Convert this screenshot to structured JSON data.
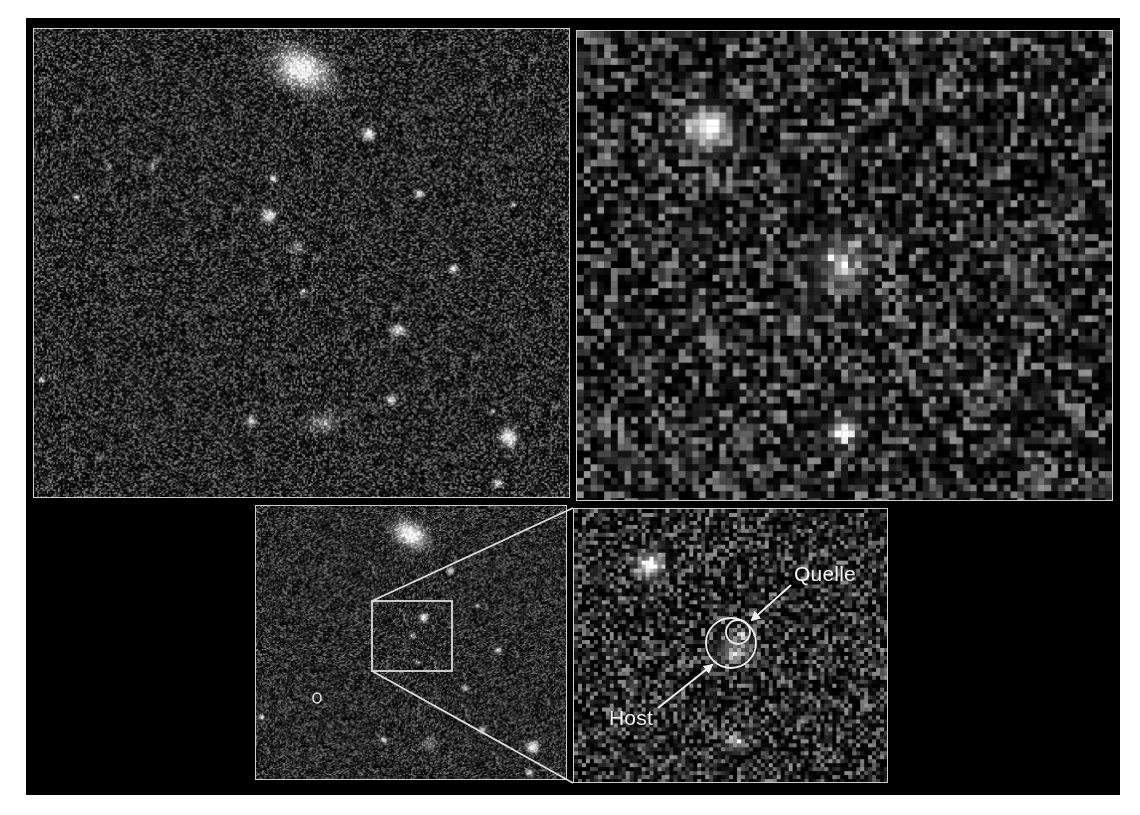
{
  "figure": {
    "background": "#000000",
    "border_color": "#cfcfcf",
    "panels": [
      {
        "id": "wide-field",
        "description": "wide field deep image, noisy background with galaxies and point sources",
        "box": [
          33,
          28,
          537,
          470
        ],
        "pixel_size": 1.6,
        "sources": [
          {
            "x": 268,
            "y": 40,
            "r": 22,
            "b": 1.0,
            "ex": 1.5,
            "rot": 0.5
          },
          {
            "x": 335,
            "y": 105,
            "r": 7,
            "b": 1.0
          },
          {
            "x": 235,
            "y": 187,
            "r": 8,
            "b": 1.0
          },
          {
            "x": 386,
            "y": 165,
            "r": 5,
            "b": 0.9
          },
          {
            "x": 240,
            "y": 150,
            "r": 4,
            "b": 0.8
          },
          {
            "x": 480,
            "y": 175,
            "r": 3,
            "b": 0.7
          },
          {
            "x": 420,
            "y": 240,
            "r": 5,
            "b": 0.9
          },
          {
            "x": 263,
            "y": 218,
            "r": 8,
            "b": 0.45
          },
          {
            "x": 270,
            "y": 263,
            "r": 4,
            "b": 0.55
          },
          {
            "x": 365,
            "y": 302,
            "r": 6,
            "b": 0.85,
            "ex": 1.6
          },
          {
            "x": 117,
            "y": 138,
            "r": 6,
            "b": 0.45
          },
          {
            "x": 75,
            "y": 138,
            "r": 3,
            "b": 0.65
          },
          {
            "x": 7,
            "y": 352,
            "r": 3,
            "b": 0.9
          },
          {
            "x": 358,
            "y": 372,
            "r": 5,
            "b": 1.0
          },
          {
            "x": 217,
            "y": 393,
            "r": 6,
            "b": 0.85
          },
          {
            "x": 290,
            "y": 395,
            "r": 12,
            "b": 0.4,
            "ex": 1.5
          },
          {
            "x": 476,
            "y": 410,
            "r": 10,
            "b": 1.0
          },
          {
            "x": 465,
            "y": 455,
            "r": 5,
            "b": 0.9
          },
          {
            "x": 460,
            "y": 383,
            "r": 3,
            "b": 0.7
          },
          {
            "x": 42,
            "y": 168,
            "r": 3,
            "b": 0.8
          }
        ]
      },
      {
        "id": "zoom-field",
        "description": "magnified view of central region, pixelated",
        "box": [
          576,
          30,
          537,
          471
        ],
        "pixel_size": 6.8,
        "sources": [
          {
            "x": 127,
            "y": 95,
            "r": 24,
            "b": 1.0
          },
          {
            "x": 262,
            "y": 230,
            "r": 30,
            "b": 0.5
          },
          {
            "x": 265,
            "y": 398,
            "r": 16,
            "b": 0.8
          }
        ]
      },
      {
        "id": "overview-inset",
        "description": "reduced wide field with zoom box",
        "box": [
          255,
          505,
          312,
          275
        ],
        "pixel_size": 1.2,
        "sources": [
          {
            "x": 155,
            "y": 28,
            "r": 14,
            "b": 1.0,
            "ex": 1.4,
            "rot": 0.5
          },
          {
            "x": 195,
            "y": 65,
            "r": 4,
            "b": 0.9
          },
          {
            "x": 168,
            "y": 112,
            "r": 5,
            "b": 1.0
          },
          {
            "x": 157,
            "y": 130,
            "r": 4,
            "b": 0.55
          },
          {
            "x": 162,
            "y": 157,
            "r": 3,
            "b": 0.6
          },
          {
            "x": 243,
            "y": 145,
            "r": 4,
            "b": 0.8
          },
          {
            "x": 210,
            "y": 183,
            "r": 4,
            "b": 0.8
          },
          {
            "x": 222,
            "y": 100,
            "r": 3,
            "b": 0.7
          },
          {
            "x": 128,
            "y": 235,
            "r": 4,
            "b": 0.8
          },
          {
            "x": 174,
            "y": 240,
            "r": 8,
            "b": 0.4
          },
          {
            "x": 278,
            "y": 242,
            "r": 7,
            "b": 1.0
          },
          {
            "x": 275,
            "y": 268,
            "r": 4,
            "b": 0.9
          },
          {
            "x": 5,
            "y": 212,
            "r": 3,
            "b": 0.9
          },
          {
            "x": 227,
            "y": 225,
            "r": 4,
            "b": 0.8
          }
        ],
        "zoom_box": [
          117,
          96,
          80,
          70
        ],
        "marker_ellipse": {
          "x": 62,
          "y": 193,
          "rx": 4,
          "ry": 5
        }
      },
      {
        "id": "annotated-zoom",
        "description": "zoomed region with host galaxy and source marked",
        "box": [
          573,
          508,
          315,
          275
        ],
        "pixel_size": 4.0,
        "sources": [
          {
            "x": 75,
            "y": 55,
            "r": 14,
            "b": 1.0
          },
          {
            "x": 158,
            "y": 140,
            "r": 18,
            "b": 0.45
          },
          {
            "x": 167,
            "y": 125,
            "r": 5,
            "b": 0.7
          },
          {
            "x": 162,
            "y": 232,
            "r": 9,
            "b": 0.65
          }
        ]
      }
    ],
    "annotations": {
      "host_circle": {
        "cx": 731,
        "cy": 643,
        "r": 25
      },
      "source_circle": {
        "cx": 738,
        "cy": 632,
        "r": 12
      },
      "labels": [
        {
          "key": "quelle",
          "text": "Quelle",
          "x": 794,
          "y": 562
        },
        {
          "key": "host",
          "text": "Host",
          "x": 609,
          "y": 706
        }
      ],
      "arrows": [
        {
          "from": [
            791,
            585
          ],
          "to": [
            752,
            620
          ]
        },
        {
          "from": [
            658,
            708
          ],
          "to": [
            712,
            665
          ]
        }
      ]
    }
  },
  "labels": {
    "quelle": "Quelle",
    "host": "Host"
  }
}
